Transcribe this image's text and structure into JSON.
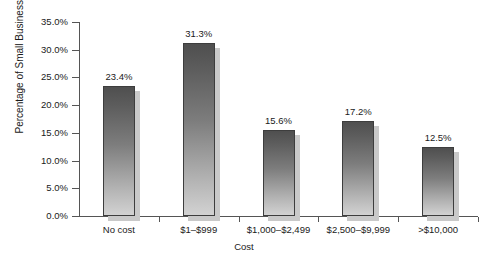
{
  "chart_data": {
    "type": "bar",
    "title": "",
    "subtitle": "",
    "xlabel": "Cost",
    "ylabel": "Percentage of Small Businesses",
    "categories": [
      "No cost",
      "$1–$999",
      "$1,000–$2,499",
      "$2,500–$9,999",
      ">$10,000"
    ],
    "values": [
      23.4,
      31.3,
      15.6,
      17.2,
      12.5
    ],
    "value_labels": [
      "23.4%",
      "31.3%",
      "15.6%",
      "17.2%",
      "12.5%"
    ],
    "ylim": [
      0,
      35
    ],
    "ytick_values": [
      0,
      5,
      10,
      15,
      20,
      25,
      30,
      35
    ],
    "ytick_labels": [
      "0.0%",
      "5.0%",
      "10.0%",
      "15.0%",
      "20.0%",
      "25.0%",
      "30.0%",
      "35.0%"
    ],
    "grid": false,
    "legend": null,
    "legend_position": "none",
    "series": [
      {
        "name": "Percentage of Small Businesses",
        "values": [
          23.4,
          31.3,
          15.6,
          17.2,
          12.5
        ]
      }
    ],
    "colors": {
      "bar_top": "#4f4f4f",
      "bar_bottom": "#d2d2d2",
      "bar_border": "#3d3d3d",
      "bar_shadow": "#c9c9c9",
      "axis": "#555555",
      "text": "#1a1a1a",
      "background": "#ffffff"
    }
  }
}
